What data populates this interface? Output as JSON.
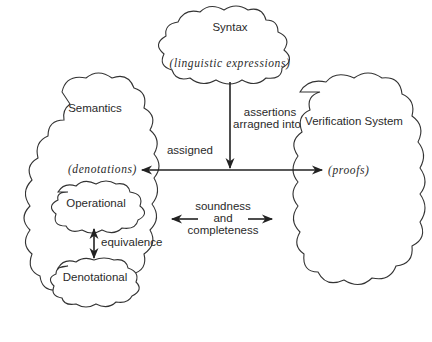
{
  "diagram": {
    "nodes": {
      "syntax": {
        "title": "Syntax",
        "subtitle": "(linguistic expressions)"
      },
      "semantics": {
        "title": "Semantics",
        "subtitle": "(denotations)"
      },
      "verification": {
        "title": "Verification System",
        "subtitle": "(proofs)"
      },
      "operational": {
        "title": "Operational"
      },
      "denotational": {
        "title": "Denotational"
      }
    },
    "edges": {
      "syntax_to_proofs": {
        "line1": "assertions",
        "line2": "arragned into"
      },
      "syntax_to_denotations": {
        "label": "assigned"
      },
      "semantics_verification": {
        "line1": "soundness",
        "line2": "and",
        "line3": "completeness"
      },
      "operational_denotational": {
        "label": "equivalence"
      }
    },
    "colors": {
      "stroke": "#333333",
      "text": "#2a2a2a",
      "background": "#ffffff"
    }
  }
}
